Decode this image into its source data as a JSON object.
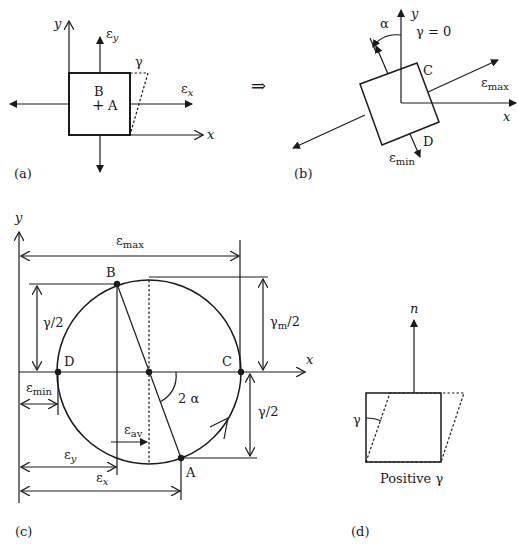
{
  "figure": {
    "panels": {
      "a": {
        "label": "(a)",
        "axis_x": "x",
        "axis_y": "y",
        "strain_x": "ε",
        "strain_x_sub": "x",
        "strain_y": "ε",
        "strain_y_sub": "y",
        "shear": "γ",
        "point_b": "B",
        "point_a": "A",
        "center_mark": "+"
      },
      "implies": "⇒",
      "b": {
        "label": "(b)",
        "axis_x": "x",
        "axis_y": "y",
        "angle": "α",
        "shear_zero": "γ = 0",
        "point_c": "C",
        "point_d": "D",
        "strain_max": "ε",
        "strain_max_sub": "max",
        "strain_min": "ε",
        "strain_min_sub": "min"
      },
      "c": {
        "label": "(c)",
        "axis_x": "x",
        "axis_y": "y",
        "dim_emax": "ε",
        "dim_emax_sub": "max",
        "dim_emin": "ε",
        "dim_emin_sub": "min",
        "dim_ey": "ε",
        "dim_ey_sub": "y",
        "dim_ex": "ε",
        "dim_ex_sub": "x",
        "dim_eav": "ε",
        "dim_eav_sub": "av",
        "gamma_half_left": "γ/2",
        "gamma_half_right": "γ/2",
        "gamma_m_half": "γ",
        "gamma_m_half_sub": "m",
        "gamma_m_half_suffix": "/2",
        "angle_2a": "2 α",
        "point_b": "B",
        "point_a": "A",
        "point_c": "C",
        "point_d": "D"
      },
      "d": {
        "label": "(d)",
        "normal": "n",
        "shear": "γ",
        "caption": "Positive γ"
      }
    }
  }
}
